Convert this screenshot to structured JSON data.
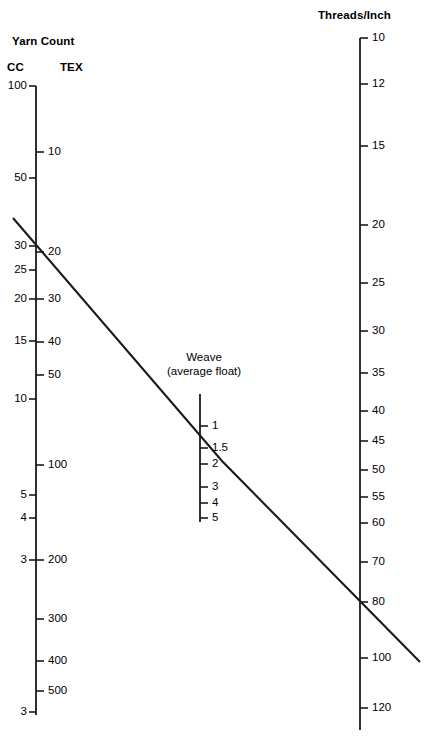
{
  "figure": {
    "kind": "nomogram",
    "background_color": "#ffffff",
    "line_color": "#1a1a1a"
  },
  "left_axis": {
    "title": "Yarn Count",
    "sub_left_label": "CC",
    "sub_right_label": "TEX",
    "cc_ticks": [
      {
        "label": "100",
        "y": 86
      },
      {
        "label": "50",
        "y": 178
      },
      {
        "label": "30",
        "y": 246
      },
      {
        "label": "25",
        "y": 270
      },
      {
        "label": "20",
        "y": 299
      },
      {
        "label": "15",
        "y": 341
      },
      {
        "label": "10",
        "y": 399
      },
      {
        "label": "5",
        "y": 495
      },
      {
        "label": "4",
        "y": 518
      },
      {
        "label": "3",
        "y": 560
      },
      {
        "label": "3",
        "y": 712
      }
    ],
    "tex_ticks": [
      {
        "label": "10",
        "y": 152
      },
      {
        "label": "20",
        "y": 252
      },
      {
        "label": "30",
        "y": 299
      },
      {
        "label": "40",
        "y": 342
      },
      {
        "label": "50",
        "y": 375
      },
      {
        "label": "100",
        "y": 465
      },
      {
        "label": "200",
        "y": 560
      },
      {
        "label": "300",
        "y": 619
      },
      {
        "label": "400",
        "y": 661
      },
      {
        "label": "500",
        "y": 691
      }
    ]
  },
  "middle_axis": {
    "title_line1": "Weave",
    "title_line2": "(average float)",
    "ticks": [
      {
        "label": "1",
        "y": 426
      },
      {
        "label": "1.5",
        "y": 448
      },
      {
        "label": "2",
        "y": 464
      },
      {
        "label": "3",
        "y": 487
      },
      {
        "label": "4",
        "y": 503
      },
      {
        "label": "5",
        "y": 518
      }
    ]
  },
  "right_axis": {
    "title": "Threads/Inch",
    "ticks": [
      {
        "label": "10",
        "y": 38
      },
      {
        "label": "12",
        "y": 84
      },
      {
        "label": "15",
        "y": 146
      },
      {
        "label": "20",
        "y": 225
      },
      {
        "label": "25",
        "y": 283
      },
      {
        "label": "30",
        "y": 331
      },
      {
        "label": "35",
        "y": 373
      },
      {
        "label": "40",
        "y": 411
      },
      {
        "label": "45",
        "y": 441
      },
      {
        "label": "50",
        "y": 470
      },
      {
        "label": "55",
        "y": 497
      },
      {
        "label": "60",
        "y": 523
      },
      {
        "label": "70",
        "y": 562
      },
      {
        "label": "80",
        "y": 602
      },
      {
        "label": "100",
        "y": 658
      },
      {
        "label": "120",
        "y": 708
      }
    ]
  },
  "chart_data": {
    "type": "line",
    "subtitle": "",
    "xlabel": "",
    "ylabel": "",
    "grid": false,
    "legend": null,
    "axes": [
      {
        "name": "Yarn Count",
        "position": "left",
        "scales": [
          {
            "name": "CC",
            "unit": "cotton count",
            "side": "left",
            "tick_labels": [
              "100",
              "50",
              "30",
              "25",
              "20",
              "15",
              "10",
              "5",
              "4",
              "3",
              "3"
            ]
          },
          {
            "name": "TEX",
            "unit": "tex",
            "side": "right",
            "tick_labels": [
              "10",
              "20",
              "30",
              "40",
              "50",
              "100",
              "200",
              "300",
              "400",
              "500"
            ]
          }
        ]
      },
      {
        "name": "Weave (average float)",
        "position": "middle",
        "scales": [
          {
            "name": "average float",
            "unit": "",
            "side": "right",
            "tick_labels": [
              "1",
              "1.5",
              "2",
              "3",
              "4",
              "5"
            ]
          }
        ]
      },
      {
        "name": "Threads/Inch",
        "position": "right",
        "scales": [
          {
            "name": "Threads/Inch",
            "unit": "threads per inch",
            "side": "right",
            "tick_labels": [
              "10",
              "12",
              "15",
              "20",
              "25",
              "30",
              "35",
              "40",
              "45",
              "50",
              "55",
              "60",
              "70",
              "80",
              "100",
              "120"
            ]
          }
        ]
      }
    ],
    "isopleth": {
      "description": "Worked example line crossing all three scales",
      "readings": [
        {
          "axis": "Yarn Count",
          "scale": "CC",
          "value": 30
        },
        {
          "axis": "Yarn Count",
          "scale": "TEX",
          "value": 20
        },
        {
          "axis": "Weave (average float)",
          "scale": "average float",
          "value": 1.5
        },
        {
          "axis": "Threads/Inch",
          "scale": "Threads/Inch",
          "value": 80
        }
      ],
      "segments": [
        {
          "from": [
            13,
            218
          ],
          "to": [
            222,
            461
          ]
        },
        {
          "from": [
            222,
            461
          ],
          "to": [
            420,
            662
          ]
        }
      ]
    }
  }
}
